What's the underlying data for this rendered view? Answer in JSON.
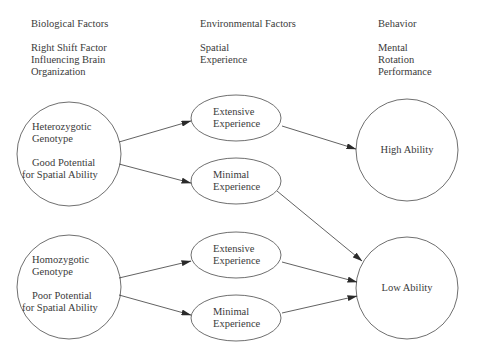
{
  "columns": [
    {
      "heading": "Biological Factors",
      "subheading": [
        "Right Shift Factor",
        "Influencing Brain",
        "Organization"
      ]
    },
    {
      "heading": "Environmental Factors",
      "subheading": [
        "Spatial",
        "Experience"
      ]
    },
    {
      "heading": "Behavior",
      "subheading": [
        "Mental",
        "Rotation",
        "Performance"
      ]
    }
  ],
  "nodes": {
    "heterozygotic": {
      "lines": [
        "Heterozygotic",
        "Genotype",
        "",
        "Good Potential",
        "for Spatial Ability"
      ]
    },
    "homozygotic": {
      "lines": [
        "Homozygotic",
        "Genotype",
        "",
        "Poor Potential",
        "for Spatial Ability"
      ]
    },
    "extensive_top": {
      "lines": [
        "Extensive",
        "Experience"
      ]
    },
    "minimal_top": {
      "lines": [
        "Minimal",
        "Experience"
      ]
    },
    "extensive_bottom": {
      "lines": [
        "Extensive",
        "Experience"
      ]
    },
    "minimal_bottom": {
      "lines": [
        "Minimal",
        "Experience"
      ]
    },
    "high_ability": {
      "lines": [
        "High Ability"
      ]
    },
    "low_ability": {
      "lines": [
        "Low Ability"
      ]
    }
  },
  "edges": [
    {
      "from": "heterozygotic",
      "to": "extensive_top"
    },
    {
      "from": "heterozygotic",
      "to": "minimal_top"
    },
    {
      "from": "extensive_top",
      "to": "high_ability"
    },
    {
      "from": "minimal_top",
      "to": "low_ability"
    },
    {
      "from": "homozygotic",
      "to": "extensive_bottom"
    },
    {
      "from": "homozygotic",
      "to": "minimal_bottom"
    },
    {
      "from": "extensive_bottom",
      "to": "low_ability"
    },
    {
      "from": "minimal_bottom",
      "to": "low_ability"
    }
  ],
  "colors": {
    "stroke": "#4a4a4a",
    "text": "#3a3a3a",
    "background": "#ffffff"
  }
}
